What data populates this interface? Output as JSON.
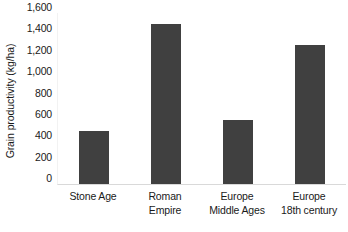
{
  "chart_data": {
    "type": "bar",
    "title": "",
    "xlabel": "",
    "ylabel": "Grain productivity (kg/ha)",
    "categories": [
      "Stone Age",
      "Roman\nEmpire",
      "Europe\nMiddle Ages",
      "Europe\n18th century"
    ],
    "values": [
      500,
      1500,
      600,
      1300
    ],
    "ylim": [
      0,
      1600
    ],
    "ytick_values": [
      1600,
      1400,
      1200,
      1000,
      800,
      600,
      400,
      200,
      0
    ],
    "ytick_labels": [
      "1,600",
      "1,400",
      "1,200",
      "1,000",
      "800",
      "600",
      "400",
      "200",
      "0"
    ],
    "grid": false,
    "legend": false,
    "bar_color": "#404040",
    "background_color": "#ffffff",
    "axis_line_color": "#d9d9d9"
  }
}
